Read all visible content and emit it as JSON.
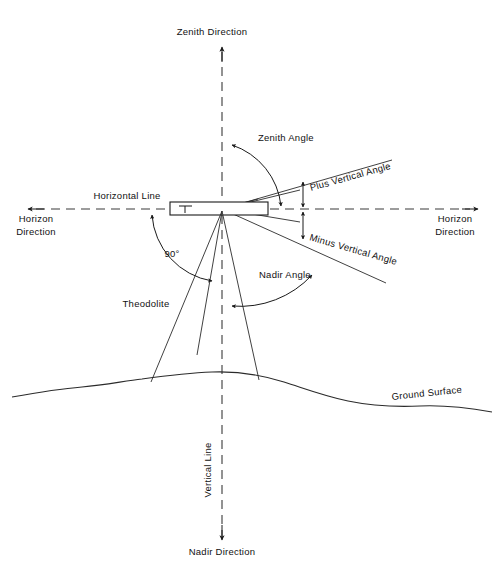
{
  "figure": {
    "type": "technical-diagram",
    "background_color": "#ffffff",
    "line_color": "#1a1a1a"
  },
  "labels": {
    "zenith_direction": "Zenith Direction",
    "zenith_angle": "Zenith Angle",
    "horizontal_line": "Horizontal Line",
    "horizon_direction_left_1": "Horizon",
    "horizon_direction_left_2": "Direction",
    "horizon_direction_right_1": "Horizon",
    "horizon_direction_right_2": "Direction",
    "plus_vertical_angle": "Plus Vertical Angle",
    "minus_vertical_angle": "Minus Vertical Angle",
    "nadir_angle": "Nadir Angle",
    "right_angle": "90°",
    "theodolite": "Theodolite",
    "ground_surface": "Ground Surface",
    "vertical_line": "Vertical Line",
    "nadir_direction": "Nadir Direction"
  },
  "geometry": {
    "instrument_center_x": 222,
    "instrument_center_y": 209,
    "vertical_axis_x": 222,
    "horizontal_axis_y": 209,
    "zenith_arrow_tip_y": 47,
    "nadir_arrow_tip_y": 540,
    "horizon_left_arrow_tip_x": 28,
    "horizon_right_arrow_tip_x": 478,
    "plus_angle_degrees": 14,
    "minus_angle_degrees": 10,
    "right_angle_degrees": 90
  }
}
